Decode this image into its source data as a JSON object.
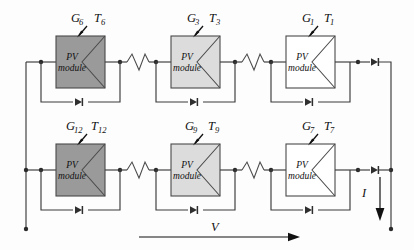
{
  "figure": {
    "module_label_line1": "PV",
    "module_label_line2": "module",
    "current_symbol": "I",
    "voltage_symbol": "V",
    "colors": {
      "shade_dark": "#9a9a9a",
      "shade_light": "#dcdcdc",
      "shade_none": "#ffffff",
      "wire": "#3b3b3b",
      "text": "#111111"
    }
  },
  "modules": [
    {
      "id": "m6",
      "row": "top",
      "col": 1,
      "irradiance_label": "G",
      "irradiance_sub": "6",
      "temperature_label": "T",
      "temperature_sub": "6",
      "shade": "dark",
      "fill": "#9a9a9a"
    },
    {
      "id": "m3",
      "row": "top",
      "col": 2,
      "irradiance_label": "G",
      "irradiance_sub": "3",
      "temperature_label": "T",
      "temperature_sub": "3",
      "shade": "light",
      "fill": "#dcdcdc"
    },
    {
      "id": "m1",
      "row": "top",
      "col": 3,
      "irradiance_label": "G",
      "irradiance_sub": "1",
      "temperature_label": "T",
      "temperature_sub": "1",
      "shade": "none",
      "fill": "#ffffff"
    },
    {
      "id": "m12",
      "row": "bottom",
      "col": 1,
      "irradiance_label": "G",
      "irradiance_sub": "12",
      "temperature_label": "T",
      "temperature_sub": "12",
      "shade": "dark",
      "fill": "#9a9a9a"
    },
    {
      "id": "m9",
      "row": "bottom",
      "col": 2,
      "irradiance_label": "G",
      "irradiance_sub": "9",
      "temperature_label": "T",
      "temperature_sub": "9",
      "shade": "light",
      "fill": "#dcdcdc"
    },
    {
      "id": "m7",
      "row": "bottom",
      "col": 3,
      "irradiance_label": "G",
      "irradiance_sub": "7",
      "temperature_label": "T",
      "temperature_sub": "7",
      "shade": "none",
      "fill": "#ffffff"
    }
  ],
  "components": {
    "bypass_diode_count": 6,
    "blocking_diode_count": 2,
    "break_symbol_count": 4,
    "string_count": 2,
    "modules_per_string_shown": 3
  }
}
